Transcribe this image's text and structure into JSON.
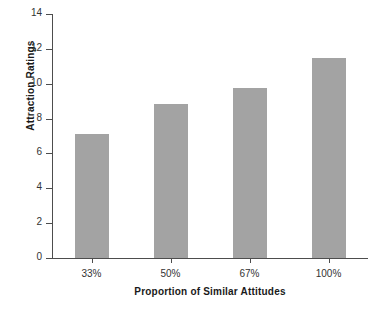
{
  "chart_data": {
    "type": "bar",
    "title": "",
    "xlabel": "Proportion of Similar Attitudes",
    "ylabel": "Attraction Ratings",
    "categories": [
      "33%",
      "50%",
      "67%",
      "100%"
    ],
    "values": [
      7.1,
      8.85,
      9.75,
      11.5
    ],
    "ylim": [
      0,
      14
    ],
    "yticks": [
      0,
      2,
      4,
      6,
      8,
      10,
      12,
      14
    ],
    "ytick_labels": [
      "0",
      "2",
      "4",
      "6",
      "8",
      "10",
      "12",
      "14"
    ],
    "grid": false,
    "legend": null,
    "bar_color": "#a3a3a3",
    "axis_color": "#4d4d4d"
  }
}
